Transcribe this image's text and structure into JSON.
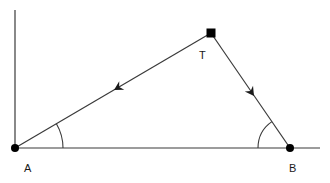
{
  "diagram": {
    "type": "geometry-triangle",
    "colors": {
      "stroke": "#3a3a3a",
      "point": "#000000",
      "background": "#ffffff"
    },
    "points": [
      {
        "id": "A",
        "label": "A",
        "shape": "circle",
        "x": 15,
        "y": 148
      },
      {
        "id": "B",
        "label": "B",
        "shape": "circle",
        "x": 290,
        "y": 148
      },
      {
        "id": "T",
        "label": "T",
        "shape": "square",
        "x": 211,
        "y": 33
      }
    ],
    "edges": [
      {
        "from": "T",
        "to": "A",
        "arrow": "toward A"
      },
      {
        "from": "T",
        "to": "B",
        "arrow": "toward B"
      },
      {
        "from": "A",
        "to": "B",
        "arrow": "none",
        "note": "baseline extends beyond B"
      }
    ],
    "axes": {
      "vertical": "line through A",
      "horizontal": "baseline through A and B"
    },
    "angles": [
      {
        "at": "A",
        "between": [
          "AB",
          "AT"
        ],
        "marked": true
      },
      {
        "at": "B",
        "between": [
          "BA",
          "BT"
        ],
        "marked": true
      }
    ]
  }
}
